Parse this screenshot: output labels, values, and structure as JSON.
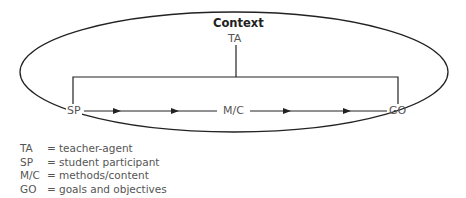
{
  "diagram": {
    "title": "Context",
    "nodes": {
      "top": "TA",
      "left": "SP",
      "middle": "M/C",
      "right": "GO"
    },
    "edges": [
      {
        "from": "TA",
        "to": "SP/GO bracket",
        "type": "line"
      },
      {
        "from": "SP",
        "to": "M/C",
        "type": "arrow",
        "arrowheads": 2
      },
      {
        "from": "M/C",
        "to": "GO",
        "type": "arrow",
        "arrowheads": 2
      }
    ],
    "container_shape": "ellipse",
    "colors": {
      "line": "#222222",
      "text": "#555555",
      "title": "#222222"
    }
  },
  "legend": [
    {
      "abbr": "TA",
      "eq": "=",
      "meaning": "teacher-agent"
    },
    {
      "abbr": "SP",
      "eq": "=",
      "meaning": "student participant"
    },
    {
      "abbr": "M/C",
      "eq": "=",
      "meaning": "methods/content"
    },
    {
      "abbr": "GO",
      "eq": "=",
      "meaning": "goals and objectives"
    }
  ]
}
